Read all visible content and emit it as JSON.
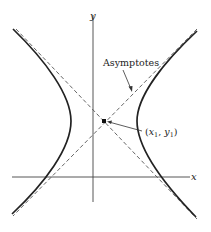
{
  "diagram": {
    "type": "hyperbola",
    "axes": {
      "x_label": "x",
      "y_label": "y"
    },
    "labels": {
      "asymptotes": "Asymptotes",
      "center_x": "x",
      "center_x_sub": "1",
      "center_sep": ", ",
      "center_y": "y",
      "center_y_sub": "1",
      "open_paren": "(",
      "close_paren": ")"
    },
    "colors": {
      "curve": "#222222",
      "axis": "#444444",
      "asymptote": "#555555",
      "text": "#222222"
    }
  }
}
